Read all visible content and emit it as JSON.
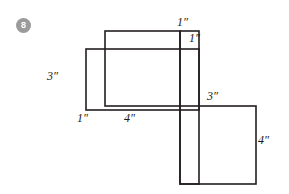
{
  "figure": {
    "problem_number": "8",
    "badge_color": "#9b9b9b",
    "stroke_color": "#231f20",
    "background_color": "#ffffff",
    "width": 289,
    "height": 194
  },
  "labels": {
    "top_right_1": "1″",
    "upper_right_1": "1″",
    "left_3": "3″",
    "bottom_left_1": "1″",
    "bottom_4": "4″",
    "right_3": "3″",
    "far_right_4": "4″"
  },
  "shapes": {
    "top_rectangle": {
      "x": 105,
      "y": 31,
      "width": 75,
      "height": 75
    },
    "left_rectangle": {
      "x": 86,
      "y": 49,
      "width": 113,
      "height": 61
    },
    "vertical_strip": {
      "x": 180,
      "y": 31,
      "width": 19,
      "height": 153
    },
    "bottom_square": {
      "x": 180,
      "y": 106,
      "width": 76,
      "height": 78
    }
  }
}
